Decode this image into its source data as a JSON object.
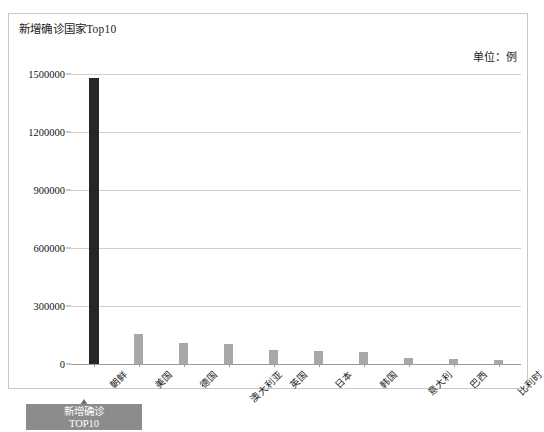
{
  "panel": {
    "title": "新增确诊国家Top10",
    "unit_label": "单位：例"
  },
  "legend_button": {
    "line1": "新增确诊",
    "line2": "TOP10"
  },
  "colors": {
    "bar_default": "#a8a8a8",
    "bar_highlight": "#262626",
    "gridline": "#cfcfcf",
    "panel_border": "#c9c9c9",
    "button_bg": "#8c8c8c"
  },
  "chart_data": {
    "type": "bar",
    "title": "新增确诊国家Top10",
    "xlabel": "",
    "ylabel": "",
    "unit": "例",
    "grid": true,
    "legend": false,
    "ylim": [
      0,
      1500000
    ],
    "yticks": [
      0,
      300000,
      600000,
      900000,
      1200000,
      1500000
    ],
    "ytick_labels": [
      "0",
      "300000",
      "600000",
      "900000",
      "1200000",
      "1500000"
    ],
    "categories": [
      "朝鲜",
      "美国",
      "德国",
      "澳大利亚",
      "英国",
      "日本",
      "韩国",
      "意大利",
      "巴西",
      "比利时"
    ],
    "values": [
      1480000,
      155000,
      110000,
      105000,
      72000,
      65000,
      62000,
      30000,
      26000,
      22000
    ],
    "highlight_index": 0
  }
}
